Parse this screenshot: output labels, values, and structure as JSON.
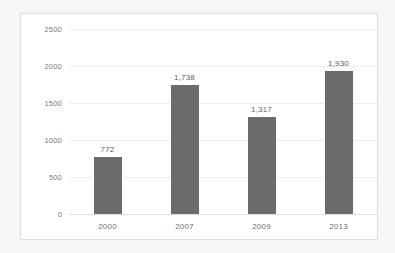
{
  "chart_data": {
    "type": "bar",
    "title": "",
    "subtitle": "",
    "xlabel": "",
    "ylabel": "",
    "categories": [
      "2000",
      "2007",
      "2009",
      "2013"
    ],
    "values": [
      772,
      1738,
      1317,
      1930
    ],
    "data_labels": [
      "772",
      "1,738",
      "1,317",
      "1,930"
    ],
    "series": [
      {
        "name": "",
        "values": [
          772,
          1738,
          1317,
          1930
        ]
      }
    ],
    "ylim": [
      0,
      2500
    ],
    "yticks": [
      0,
      500,
      1000,
      1500,
      2000,
      2500
    ],
    "ytick_labels": [
      "0",
      "500",
      "1000",
      "1500",
      "2000",
      "2500"
    ],
    "grid": "horizontal",
    "legend": "none",
    "bar_color": "#6b6b6b",
    "gridline_color": "#ededed",
    "plot_background": "#ffffff",
    "frame_color": "#dcdcdc",
    "label_color": "#5f5f5f",
    "tick_color": "#7a7a7a"
  }
}
